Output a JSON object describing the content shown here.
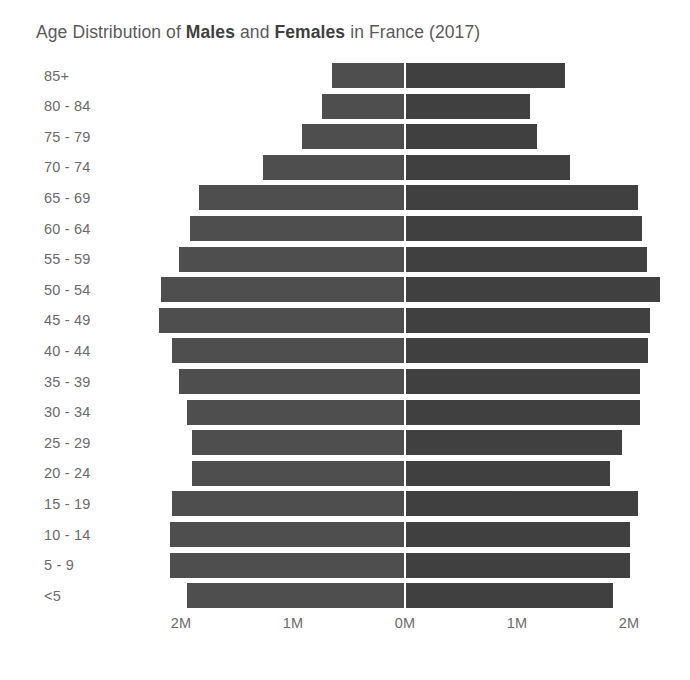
{
  "title": {
    "prefix": "Age Distribution of ",
    "bold1": "Males",
    "mid": " and ",
    "bold2": "Females",
    "suffix": " in France (2017)",
    "full": "Age Distribution of Males and Females in France (2017)"
  },
  "colors": {
    "background": "#ffffff",
    "male_bar": "#4a4a4a",
    "female_bar": "#3b3b3b",
    "label_text": "#6b6b6b",
    "title_text": "#5a5a5a"
  },
  "chart_data": {
    "type": "bar",
    "subtype": "population-pyramid",
    "title": "Age Distribution of Males and Females in France (2017)",
    "xlabel": "",
    "ylabel": "",
    "orientation": "horizontal",
    "grid": false,
    "legend": "none",
    "xlim": [
      -2400000,
      2400000
    ],
    "xticks": [
      -2000000,
      -1000000,
      0,
      1000000,
      2000000
    ],
    "xtick_labels": [
      "2M",
      "1M",
      "0M",
      "1M",
      "2M"
    ],
    "axis_units": "millions of people",
    "categories": [
      "85+",
      "80 - 84",
      "75 - 79",
      "70 - 74",
      "65 - 69",
      "60 - 64",
      "55 - 59",
      "50 - 54",
      "45 - 49",
      "40 - 44",
      "35 - 39",
      "30 - 34",
      "25 - 29",
      "20 - 24",
      "15 - 19",
      "10 - 14",
      "5 - 9",
      "<5"
    ],
    "series": [
      {
        "name": "Males",
        "side": "left",
        "values": [
          0.65,
          0.74,
          0.92,
          1.27,
          1.84,
          1.92,
          2.02,
          2.18,
          2.2,
          2.08,
          2.02,
          1.95,
          1.9,
          1.9,
          2.08,
          2.1,
          2.1,
          1.95
        ]
      },
      {
        "name": "Females",
        "side": "right",
        "values": [
          1.43,
          1.12,
          1.18,
          1.47,
          2.08,
          2.12,
          2.16,
          2.28,
          2.19,
          2.17,
          2.1,
          2.1,
          1.94,
          1.83,
          2.08,
          2.01,
          2.01,
          1.86
        ]
      }
    ]
  },
  "axis": {
    "center_label": "0M",
    "ticks": [
      {
        "label": "2M",
        "value": -2000000
      },
      {
        "label": "1M",
        "value": -1000000
      },
      {
        "label": "0M",
        "value": 0
      },
      {
        "label": "1M",
        "value": 1000000
      },
      {
        "label": "2M",
        "value": 2000000
      }
    ]
  },
  "geometry": {
    "center_x": 405,
    "px_per_million": 112,
    "row_pitch": 30.6,
    "bar_height": 25,
    "plot_top": 60
  }
}
